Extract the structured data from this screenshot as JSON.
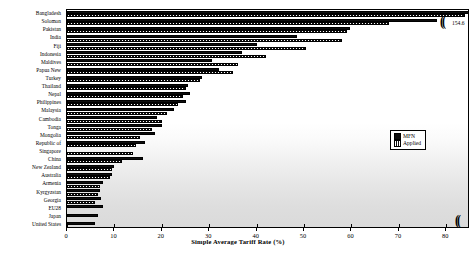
{
  "chart_data": {
    "type": "bar",
    "orientation": "horizontal",
    "title": "",
    "xlabel": "Simple Average Tariff Rate (%)",
    "ylabel": "",
    "xlim": [
      0,
      85
    ],
    "xticks": [
      0,
      10,
      20,
      30,
      40,
      50,
      60,
      70,
      80
    ],
    "grid": false,
    "legend_position": "center-right",
    "axis_break": {
      "present": true,
      "symbol": "((",
      "outlier_label": "154.6",
      "outlier_series": "MFN",
      "outlier_category": "Bangladesh"
    },
    "categories": [
      "Bangladesh",
      "Solomon",
      "Pakistan",
      "India",
      "Fiji",
      "Indonesia",
      "Maldives",
      "Papua New",
      "Turkey",
      "Thailand",
      "Nepal",
      "Philippines",
      "Malaysia",
      "Cambodia",
      "Tonga",
      "Mongolia",
      "Republic of",
      "Singapore",
      "China",
      "New Zealand",
      "Australia",
      "Armenia",
      "Kyrgyzstan",
      "Georgia",
      "EU28",
      "Japan",
      "United States"
    ],
    "series": [
      {
        "name": "MFN",
        "values": [
          154.6,
          78.0,
          59.6,
          48.5,
          40.0,
          37.0,
          30.5,
          32.0,
          28.5,
          25.5,
          26.0,
          25.0,
          22.5,
          19.0,
          20.0,
          18.5,
          16.5,
          0.0,
          16.0,
          10.0,
          9.5,
          7.5,
          7.0,
          7.2,
          7.5,
          6.5,
          6.0
        ]
      },
      {
        "name": "Applied",
        "values": [
          84.0,
          68.0,
          59.0,
          58.0,
          50.5,
          42.0,
          36.0,
          35.0,
          28.0,
          25.0,
          24.5,
          23.5,
          21.0,
          20.0,
          18.0,
          15.5,
          14.5,
          14.0,
          11.5,
          9.5,
          9.0,
          7.0,
          6.5,
          6.0,
          0.0,
          0.0,
          0.0
        ]
      }
    ],
    "legend_entries": [
      "MFN",
      "Applied"
    ]
  },
  "legend": {
    "mfn_label": "MFN",
    "applied_label": "Applied"
  },
  "axis": {
    "x_title": "Simple Average Tariff Rate (%)"
  }
}
